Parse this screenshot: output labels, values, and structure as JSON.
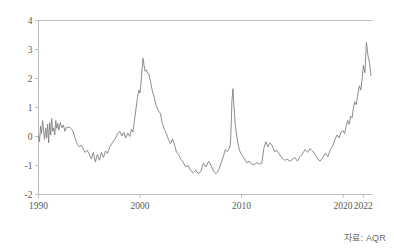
{
  "chart_data": {
    "type": "line",
    "title": "",
    "subtitle": "",
    "xlabel": "",
    "ylabel": "",
    "xlim": [
      1990,
      2022.9
    ],
    "ylim": [
      -2,
      4
    ],
    "grid": false,
    "legend": null,
    "line_color": "#808080",
    "axis_color": "#bfbfbf",
    "x_ticks": [
      1990,
      2000,
      2010,
      2020,
      2022
    ],
    "x_tick_labels": [
      "1990",
      "2000",
      "2010",
      "2020",
      "2022"
    ],
    "y_ticks": [
      -2,
      -1,
      0,
      1,
      2,
      3,
      4
    ],
    "y_tick_labels": [
      "-2",
      "-1",
      "0",
      "1",
      "2",
      "3",
      "4"
    ],
    "series": [
      {
        "name": "value",
        "x": [
          1990.0,
          1990.1,
          1990.2,
          1990.3,
          1990.4,
          1990.5,
          1990.6,
          1990.7,
          1990.8,
          1990.9,
          1991.0,
          1991.1,
          1991.2,
          1991.3,
          1991.4,
          1991.5,
          1991.6,
          1991.7,
          1991.8,
          1991.9,
          1992.0,
          1992.15,
          1992.3,
          1992.45,
          1992.6,
          1992.75,
          1992.9,
          1993.0,
          1993.2,
          1993.4,
          1993.6,
          1993.8,
          1994.0,
          1994.2,
          1994.4,
          1994.6,
          1994.8,
          1995.0,
          1995.2,
          1995.4,
          1995.6,
          1995.8,
          1996.0,
          1996.2,
          1996.4,
          1996.6,
          1996.8,
          1997.0,
          1997.2,
          1997.4,
          1997.6,
          1997.8,
          1998.0,
          1998.2,
          1998.4,
          1998.6,
          1998.8,
          1999.0,
          1999.15,
          1999.3,
          1999.45,
          1999.6,
          1999.75,
          1999.9,
          2000.0,
          2000.1,
          2000.2,
          2000.3,
          2000.4,
          2000.5,
          2000.6,
          2000.7,
          2000.85,
          2001.0,
          2001.2,
          2001.4,
          2001.6,
          2001.8,
          2002.0,
          2002.2,
          2002.4,
          2002.6,
          2002.8,
          2003.0,
          2003.2,
          2003.4,
          2003.6,
          2003.8,
          2004.0,
          2004.25,
          2004.5,
          2004.75,
          2005.0,
          2005.25,
          2005.5,
          2005.75,
          2006.0,
          2006.25,
          2006.5,
          2006.75,
          2007.0,
          2007.25,
          2007.5,
          2007.75,
          2008.0,
          2008.2,
          2008.4,
          2008.6,
          2008.8,
          2008.9,
          2009.0,
          2009.05,
          2009.15,
          2009.25,
          2009.4,
          2009.6,
          2009.8,
          2010.0,
          2010.25,
          2010.5,
          2010.75,
          2011.0,
          2011.25,
          2011.5,
          2011.75,
          2012.0,
          2012.2,
          2012.4,
          2012.6,
          2012.8,
          2013.0,
          2013.25,
          2013.5,
          2013.75,
          2014.0,
          2014.25,
          2014.5,
          2014.75,
          2015.0,
          2015.25,
          2015.5,
          2015.75,
          2016.0,
          2016.25,
          2016.5,
          2016.75,
          2017.0,
          2017.25,
          2017.5,
          2017.75,
          2018.0,
          2018.25,
          2018.5,
          2018.75,
          2019.0,
          2019.2,
          2019.4,
          2019.6,
          2019.8,
          2020.0,
          2020.15,
          2020.3,
          2020.45,
          2020.6,
          2020.75,
          2020.9,
          2021.0,
          2021.15,
          2021.3,
          2021.45,
          2021.6,
          2021.75,
          2021.9,
          2022.0,
          2022.15,
          2022.3,
          2022.45,
          2022.6,
          2022.75
        ],
        "y": [
          0.02,
          -0.18,
          0.35,
          0.1,
          0.55,
          0.2,
          -0.1,
          0.3,
          -0.05,
          0.42,
          -0.22,
          0.48,
          0.05,
          0.62,
          0.18,
          0.3,
          0.05,
          0.55,
          0.28,
          0.45,
          0.22,
          0.48,
          0.3,
          0.4,
          0.18,
          0.32,
          0.3,
          0.33,
          0.28,
          0.18,
          -0.05,
          -0.25,
          -0.35,
          -0.3,
          -0.42,
          -0.55,
          -0.48,
          -0.6,
          -0.78,
          -0.55,
          -0.88,
          -0.62,
          -0.82,
          -0.55,
          -0.72,
          -0.5,
          -0.58,
          -0.38,
          -0.25,
          -0.15,
          -0.05,
          0.1,
          0.18,
          0.02,
          0.15,
          -0.05,
          0.12,
          0.0,
          0.25,
          0.15,
          0.55,
          0.95,
          1.35,
          1.6,
          1.5,
          1.85,
          2.3,
          2.7,
          2.45,
          2.25,
          2.3,
          2.2,
          2.18,
          1.95,
          1.6,
          1.35,
          1.05,
          0.9,
          0.8,
          0.45,
          0.25,
          0.1,
          -0.1,
          -0.25,
          -0.08,
          -0.3,
          -0.55,
          -0.62,
          -0.78,
          -0.88,
          -1.05,
          -1.0,
          -1.18,
          -1.25,
          -1.15,
          -1.28,
          -1.2,
          -0.92,
          -1.05,
          -0.85,
          -1.0,
          -1.2,
          -1.28,
          -1.15,
          -0.9,
          -0.7,
          -0.45,
          -0.52,
          -0.4,
          -0.3,
          0.55,
          1.2,
          1.65,
          1.05,
          0.35,
          -0.15,
          -0.48,
          -0.62,
          -0.75,
          -0.9,
          -0.85,
          -0.95,
          -0.98,
          -0.9,
          -0.95,
          -0.92,
          -0.4,
          -0.18,
          -0.35,
          -0.22,
          -0.3,
          -0.52,
          -0.48,
          -0.62,
          -0.75,
          -0.82,
          -0.78,
          -0.85,
          -0.8,
          -0.72,
          -0.85,
          -0.7,
          -0.6,
          -0.45,
          -0.55,
          -0.42,
          -0.5,
          -0.62,
          -0.78,
          -0.85,
          -0.72,
          -0.58,
          -0.7,
          -0.45,
          -0.3,
          -0.1,
          0.05,
          -0.05,
          0.15,
          0.2,
          0.1,
          0.35,
          0.55,
          0.42,
          0.7,
          0.65,
          0.95,
          1.2,
          1.1,
          1.45,
          1.75,
          1.6,
          2.05,
          2.45,
          2.2,
          3.25,
          2.8,
          2.55,
          2.1
        ]
      }
    ],
    "annotations": []
  },
  "axes": {
    "source_note": "자료: AQR"
  }
}
